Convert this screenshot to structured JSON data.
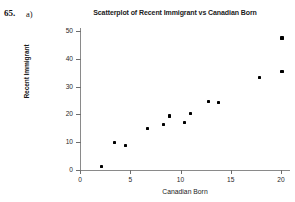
{
  "exercise": {
    "number": "65.",
    "part": "a)"
  },
  "chart_data": {
    "type": "scatter",
    "title": "Scatterplot of Recent Immigrant vs Canadian Born",
    "xlabel": "Canadian Born",
    "ylabel": "Recent Immigrant",
    "xlim": [
      0,
      21
    ],
    "ylim": [
      0,
      52
    ],
    "grid": false,
    "legend": null,
    "xticks": [
      0,
      5,
      10,
      15,
      20
    ],
    "xtick_labels": [
      "0",
      "5",
      "10",
      "15",
      "20"
    ],
    "yticks": [
      0,
      10,
      20,
      30,
      40,
      50
    ],
    "ytick_labels": [
      "0",
      "10",
      "20",
      "30",
      "40",
      "50"
    ],
    "marker": "square",
    "marker_color": "#000000",
    "axis_color": "#8a8a8a",
    "background_color": "#ffffff",
    "points": [
      {
        "x": 2.1,
        "y": 1.2
      },
      {
        "x": 3.4,
        "y": 10.0
      },
      {
        "x": 4.5,
        "y": 8.9
      },
      {
        "x": 6.7,
        "y": 15.0
      },
      {
        "x": 8.3,
        "y": 16.3
      },
      {
        "x": 8.9,
        "y": 19.4
      },
      {
        "x": 10.4,
        "y": 17.1
      },
      {
        "x": 11.0,
        "y": 20.2
      },
      {
        "x": 12.8,
        "y": 24.6
      },
      {
        "x": 13.8,
        "y": 24.4
      },
      {
        "x": 17.9,
        "y": 33.4
      },
      {
        "x": 20.1,
        "y": 35.3
      },
      {
        "x": 20.1,
        "y": 47.5
      }
    ]
  }
}
